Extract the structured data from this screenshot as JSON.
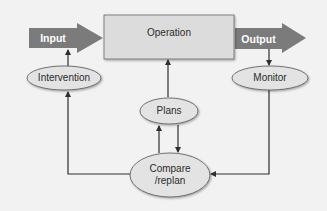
{
  "diagram": {
    "nodes": {
      "input": {
        "label": "Input",
        "shape": "block-arrow"
      },
      "operation": {
        "label": "Operation",
        "shape": "rectangle"
      },
      "output": {
        "label": "Output",
        "shape": "block-arrow"
      },
      "intervention": {
        "label": "Intervention",
        "shape": "ellipse"
      },
      "monitor": {
        "label": "Monitor",
        "shape": "ellipse"
      },
      "plans": {
        "label": "Plans",
        "shape": "ellipse"
      },
      "compare": {
        "label_line1": "Compare",
        "label_line2": "/replan",
        "shape": "ellipse"
      }
    },
    "edges": [
      {
        "from": "input",
        "to": "operation"
      },
      {
        "from": "operation",
        "to": "output"
      },
      {
        "from": "intervention",
        "to": "input"
      },
      {
        "from": "output",
        "to": "monitor"
      },
      {
        "from": "plans",
        "to": "operation"
      },
      {
        "from": "compare",
        "to": "plans"
      },
      {
        "from": "plans",
        "to": "compare"
      },
      {
        "from": "monitor",
        "to": "compare"
      },
      {
        "from": "compare",
        "to": "intervention"
      }
    ],
    "colors": {
      "background": "#f2f2f2",
      "block_arrow": "#7b7b7b",
      "box_fill": "#dcdcdc",
      "ellipse_fill": "#e3e3e3",
      "stroke": "#3a3a3a",
      "text": "#2b2b2b"
    }
  }
}
